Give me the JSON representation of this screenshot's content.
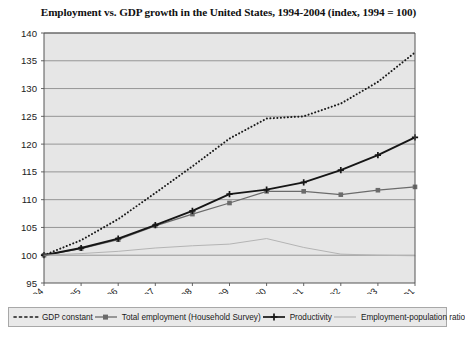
{
  "chart_data": {
    "type": "line",
    "title": "Employment vs. GDP growth in the United States, 1994-2004 (index, 1994 = 100)",
    "xlabel": "",
    "ylabel": "",
    "ylim": [
      95,
      140
    ],
    "ytick_step": 5,
    "yticks": [
      "95",
      "100",
      "105",
      "110",
      "115",
      "120",
      "125",
      "130",
      "135",
      "140"
    ],
    "grid": true,
    "legend_position": "bottom",
    "categories": [
      "1994",
      "1995",
      "1996",
      "1997",
      "1998",
      "1999",
      "2000",
      "2001",
      "2002",
      "2003",
      "2004 Q1"
    ],
    "series": [
      {
        "name": "GDP constant",
        "style": "dotted",
        "color": "#1a1a1a",
        "values": [
          100.0,
          102.7,
          106.5,
          111.2,
          116.0,
          121.0,
          124.6,
          125.0,
          127.3,
          131.2,
          136.5
        ]
      },
      {
        "name": "Total employment (Household Survey)",
        "style": "solid-marker",
        "color": "#6b6b6b",
        "values": [
          100.0,
          101.2,
          102.8,
          105.3,
          107.4,
          109.4,
          111.5,
          111.5,
          110.9,
          111.7,
          112.3
        ]
      },
      {
        "name": "Productivity",
        "style": "solid-bold-marker",
        "color": "#161616",
        "values": [
          100.0,
          101.3,
          103.0,
          105.4,
          108.0,
          111.0,
          111.8,
          113.1,
          115.3,
          118.0,
          121.2
        ]
      },
      {
        "name": "Employment-population ratio",
        "style": "thin-plain",
        "color": "#b4b4b4",
        "values": [
          100.0,
          100.3,
          100.7,
          101.3,
          101.7,
          102.0,
          103.0,
          101.4,
          100.2,
          100.0,
          99.9
        ]
      }
    ]
  },
  "legend": {
    "items": [
      {
        "label": "GDP constant",
        "marker": "dotted-line-marker"
      },
      {
        "label": "Total employment (Household Survey)",
        "marker": "solid-square-marker"
      },
      {
        "label": "Productivity",
        "marker": "bold-cross-marker"
      },
      {
        "label": "Employment-population ratio",
        "marker": "thin-line-marker"
      }
    ]
  },
  "colors": {
    "plot_background": "#e6e6e6",
    "gridline": "#8c8c8c",
    "axis": "#555555",
    "page_background": "#ffffff"
  }
}
